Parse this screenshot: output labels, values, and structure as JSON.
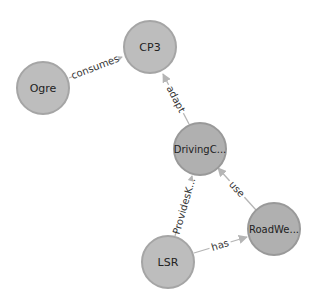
{
  "graph": {
    "colors": {
      "node_fill": "#bdbdbd",
      "node_stroke": "#a5a5a5",
      "edge": "#b5b5b5",
      "label": "#222222",
      "background": "#ffffff"
    },
    "nodes": [
      {
        "id": "cp3",
        "label": "CP3"
      },
      {
        "id": "ogre",
        "label": "Ogre"
      },
      {
        "id": "drivingc",
        "label": "DrivingC..."
      },
      {
        "id": "roadwe",
        "label": "RoadWe..."
      },
      {
        "id": "lsr",
        "label": "LSR"
      }
    ],
    "edges": [
      {
        "from": "Ogre",
        "to": "CP3",
        "label": "consumes"
      },
      {
        "from": "DrivingC...",
        "to": "CP3",
        "label": "adapt"
      },
      {
        "from": "LSR",
        "to": "DrivingC...",
        "label": "ProvidesK..."
      },
      {
        "from": "RoadWe...",
        "to": "DrivingC...",
        "label": "use"
      },
      {
        "from": "LSR",
        "to": "RoadWe...",
        "label": "has"
      }
    ]
  }
}
